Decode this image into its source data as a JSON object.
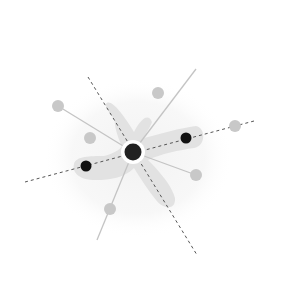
{
  "diagram": {
    "type": "network-star",
    "background": "#ffffff",
    "colors": {
      "blob": "#e2e2e2",
      "halo": "#f4f4f4",
      "solid_line": "#c4c4c4",
      "dashed_line": "#555555",
      "gray_node": "#c8c8c8",
      "black_node": "#111111",
      "center_node": "#222222",
      "center_ring": "#ffffff"
    },
    "center_node": {
      "x": 133,
      "y": 152,
      "r": 8,
      "ring_r": 12
    },
    "black_nodes": [
      {
        "x": 86,
        "y": 166,
        "r": 5
      },
      {
        "x": 186,
        "y": 138,
        "r": 5
      }
    ],
    "gray_nodes": [
      {
        "x": 58,
        "y": 106,
        "r": 6
      },
      {
        "x": 90,
        "y": 138,
        "r": 6
      },
      {
        "x": 158,
        "y": 93,
        "r": 6
      },
      {
        "x": 235,
        "y": 126,
        "r": 6
      },
      {
        "x": 196,
        "y": 175,
        "r": 6
      },
      {
        "x": 110,
        "y": 209,
        "r": 6
      }
    ],
    "dashed_lines": [
      {
        "x1": 88,
        "y1": 77,
        "x2": 197,
        "y2": 255
      },
      {
        "x1": 25,
        "y1": 182,
        "x2": 254,
        "y2": 121
      }
    ],
    "solid_lines": [
      {
        "x1": 58,
        "y1": 106,
        "x2": 133,
        "y2": 152
      },
      {
        "x1": 196,
        "y1": 69,
        "x2": 133,
        "y2": 152
      },
      {
        "x1": 133,
        "y1": 152,
        "x2": 97,
        "y2": 240
      },
      {
        "x1": 133,
        "y1": 152,
        "x2": 196,
        "y2": 175
      }
    ]
  }
}
